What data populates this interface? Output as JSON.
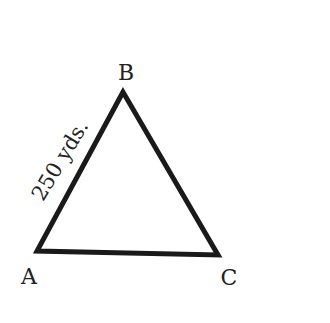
{
  "diagram": {
    "type": "triangle",
    "vertices": {
      "A": {
        "label": "A"
      },
      "B": {
        "label": "B"
      },
      "C": {
        "label": "C"
      }
    },
    "side_AB": {
      "label": "250 yds."
    },
    "stroke_color": "#1a1a1a"
  }
}
